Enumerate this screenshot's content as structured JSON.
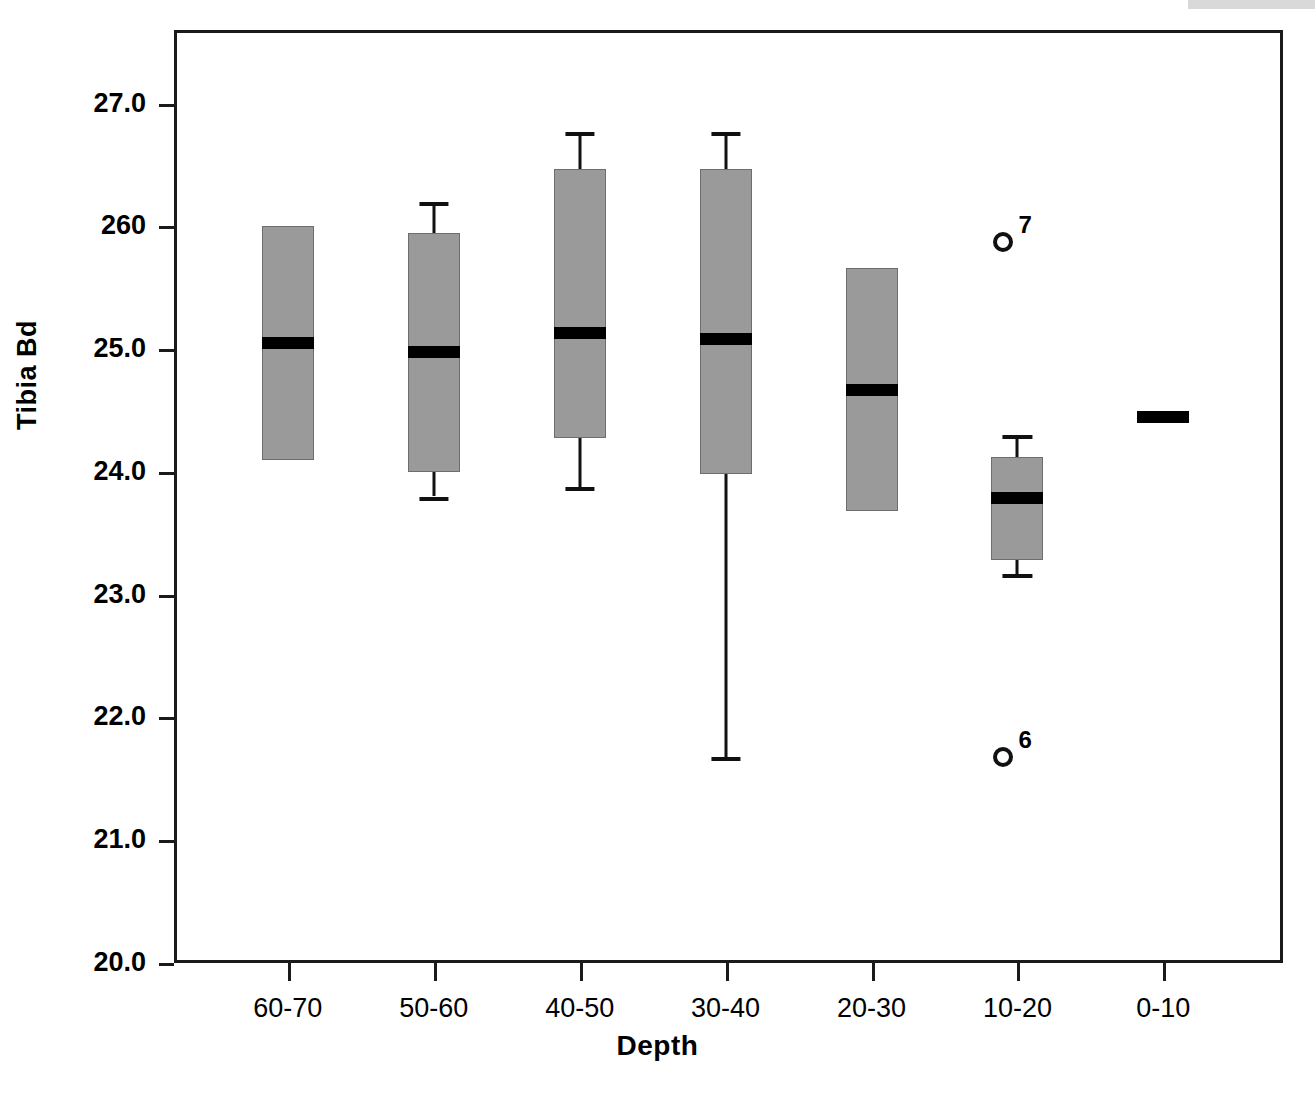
{
  "chart_data": {
    "type": "box",
    "title": "",
    "xlabel": "Depth",
    "ylabel": "Tibia Bd",
    "categories": [
      "60-70",
      "50-60",
      "40-50",
      "30-40",
      "20-30",
      "10-20",
      "0-10"
    ],
    "ylim": [
      20.0,
      27.6
    ],
    "yticks": [
      20.0,
      21.0,
      22.0,
      23.0,
      24.0,
      26.0,
      27.0
    ],
    "ytick_labels": [
      "20.0",
      "21.0",
      "22.0",
      "23.0",
      "24.0",
      "25.0",
      "260",
      "27.0"
    ],
    "grid": false,
    "legend": "none",
    "boxes": [
      {
        "category": "60-70",
        "q1": 24.1,
        "median": 25.05,
        "q3": 26.0,
        "whisker_low": null,
        "whisker_high": null,
        "outliers": []
      },
      {
        "category": "50-60",
        "q1": 24.0,
        "median": 24.98,
        "q3": 25.95,
        "whisker_low": 23.8,
        "whisker_high": 26.2,
        "outliers": []
      },
      {
        "category": "40-50",
        "q1": 24.28,
        "median": 25.13,
        "q3": 26.47,
        "whisker_low": 23.88,
        "whisker_high": 26.77,
        "outliers": []
      },
      {
        "category": "30-40",
        "q1": 23.98,
        "median": 25.08,
        "q3": 26.47,
        "whisker_low": 21.68,
        "whisker_high": 26.77,
        "outliers": []
      },
      {
        "category": "20-30",
        "q1": 23.68,
        "median": 24.67,
        "q3": 25.66,
        "whisker_low": null,
        "whisker_high": null,
        "outliers": []
      },
      {
        "category": "10-20",
        "q1": 23.28,
        "median": 23.79,
        "q3": 24.12,
        "whisker_low": 23.17,
        "whisker_high": 24.3,
        "outliers": [
          {
            "value": 25.87,
            "label": "7"
          },
          {
            "value": 21.68,
            "label": "6"
          }
        ]
      },
      {
        "category": "0-10",
        "q1": null,
        "median": 24.45,
        "q3": null,
        "whisker_low": null,
        "whisker_high": null,
        "outliers": []
      }
    ],
    "colors": {
      "box_fill": "#9a9a9a",
      "box_edge": "#6e6e6e",
      "median": "#000000",
      "whisker": "#111111",
      "axis": "#1a1a1a",
      "background": "#ffffff"
    }
  }
}
